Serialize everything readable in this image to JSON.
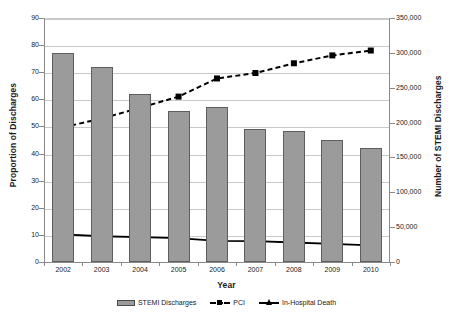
{
  "chart_data": {
    "type": "bar",
    "title": "",
    "xlabel": "Year",
    "ylabel": "Proportion of Discharges",
    "ylabel_right": "Number of STEMI Discharges",
    "categories": [
      "2002",
      "2003",
      "2004",
      "2005",
      "2006",
      "2007",
      "2008",
      "2009",
      "2010"
    ],
    "ylim": [
      0,
      90
    ],
    "ylim_right": [
      0,
      350000
    ],
    "yticks": [
      "0",
      "10",
      "20",
      "30",
      "40",
      "50",
      "60",
      "70",
      "80",
      "90"
    ],
    "yticks_right": [
      "0",
      "50,000",
      "100,000",
      "150,000",
      "200,000",
      "250,000",
      "300,000",
      "350,000"
    ],
    "grid": true,
    "legend_position": "bottom",
    "series": [
      {
        "name": "STEMI Discharges",
        "type": "bar",
        "axis": "right",
        "color": "#9b9b9b",
        "values": [
          308000,
          288000,
          247000,
          223000,
          229000,
          196000,
          194000,
          180000,
          169000
        ],
        "values_left_scale": [
          77.0,
          72.0,
          61.8,
          55.8,
          57.3,
          49.0,
          48.5,
          44.9,
          42.2
        ]
      },
      {
        "name": "PCI",
        "type": "line",
        "axis": "left",
        "color": "#000000",
        "linestyle": "dashed",
        "marker": "square",
        "values": [
          49.7,
          52.9,
          56.9,
          61.0,
          67.7,
          69.7,
          73.3,
          76.2,
          78.0
        ]
      },
      {
        "name": "In-Hospital Death",
        "type": "line",
        "axis": "left",
        "color": "#000000",
        "linestyle": "solid",
        "marker": "triangle",
        "values": [
          10.2,
          9.5,
          9.2,
          8.8,
          7.8,
          7.7,
          7.2,
          6.7,
          6.1
        ]
      }
    ]
  },
  "legend": {
    "items": [
      {
        "label": "STEMI Discharges"
      },
      {
        "label": "PCI"
      },
      {
        "label": "In-Hospital Death"
      }
    ]
  }
}
